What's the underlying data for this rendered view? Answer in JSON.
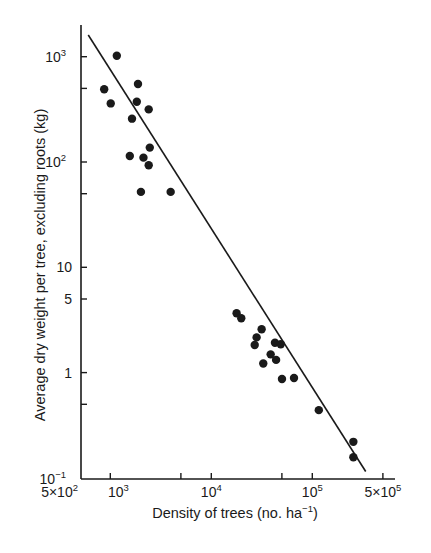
{
  "chart_data": {
    "type": "scatter",
    "title": "",
    "xlabel": "Density of trees (no. ha⁻¹)",
    "ylabel": "Average dry weight per tree, excluding roots (kg)",
    "xscale": "log",
    "yscale": "log",
    "xlim": [
      500,
      500000
    ],
    "ylim": [
      0.1,
      1600
    ],
    "grid": false,
    "legend": null,
    "x_ticks": [
      {
        "value": 500,
        "label": "5×10",
        "exp": "2"
      },
      {
        "value": 1000,
        "label": "10",
        "exp": "3"
      },
      {
        "value": 5000,
        "label": "",
        "exp": ""
      },
      {
        "value": 10000,
        "label": "10",
        "exp": "4"
      },
      {
        "value": 50000,
        "label": "",
        "exp": ""
      },
      {
        "value": 100000,
        "label": "10",
        "exp": "5"
      },
      {
        "value": 500000,
        "label": "5×10",
        "exp": "5"
      }
    ],
    "y_ticks": [
      {
        "value": 1000,
        "label": "10",
        "exp": "3"
      },
      {
        "value": 500,
        "label": "",
        "exp": ""
      },
      {
        "value": 100,
        "label": "10",
        "exp": "2"
      },
      {
        "value": 50,
        "label": "",
        "exp": ""
      },
      {
        "value": 10,
        "label": "10",
        "exp": ""
      },
      {
        "value": 5,
        "label": "5",
        "exp": ""
      },
      {
        "value": 1,
        "label": "1",
        "exp": ""
      },
      {
        "value": 0.5,
        "label": "",
        "exp": ""
      },
      {
        "value": 0.1,
        "label": "10",
        "exp": "−1"
      }
    ],
    "series": [
      {
        "name": "observed stands",
        "marker": "filled-circle",
        "points": [
          {
            "x": 870,
            "y": 490
          },
          {
            "x": 1010,
            "y": 360
          },
          {
            "x": 1160,
            "y": 1020
          },
          {
            "x": 1640,
            "y": 258
          },
          {
            "x": 1880,
            "y": 550
          },
          {
            "x": 1830,
            "y": 374
          },
          {
            "x": 2400,
            "y": 316
          },
          {
            "x": 2460,
            "y": 137
          },
          {
            "x": 1560,
            "y": 114
          },
          {
            "x": 2130,
            "y": 110
          },
          {
            "x": 2400,
            "y": 93
          },
          {
            "x": 2010,
            "y": 52
          },
          {
            "x": 3960,
            "y": 52
          },
          {
            "x": 17800,
            "y": 3.66
          },
          {
            "x": 19800,
            "y": 3.28
          },
          {
            "x": 31500,
            "y": 2.58
          },
          {
            "x": 28100,
            "y": 2.16
          },
          {
            "x": 26900,
            "y": 1.83
          },
          {
            "x": 42700,
            "y": 1.92
          },
          {
            "x": 48700,
            "y": 1.86
          },
          {
            "x": 38700,
            "y": 1.49
          },
          {
            "x": 43800,
            "y": 1.32
          },
          {
            "x": 32700,
            "y": 1.22
          },
          {
            "x": 50100,
            "y": 0.87
          },
          {
            "x": 65900,
            "y": 0.89
          },
          {
            "x": 116000,
            "y": 0.44
          },
          {
            "x": 255000,
            "y": 0.22
          },
          {
            "x": 255000,
            "y": 0.157
          }
        ]
      },
      {
        "name": "fitted line",
        "type": "line",
        "points": [
          {
            "x": 605,
            "y": 1607
          },
          {
            "x": 338000,
            "y": 0.115
          }
        ]
      }
    ]
  },
  "labels": {
    "xlabel_main": "Density of trees (no. ha",
    "xlabel_exp": "−1",
    "xlabel_close": ")",
    "ylabel": "Average dry weight per tree, excluding roots (kg)"
  },
  "style": {
    "ink": "#1a1a1a",
    "background": "#ffffff"
  }
}
